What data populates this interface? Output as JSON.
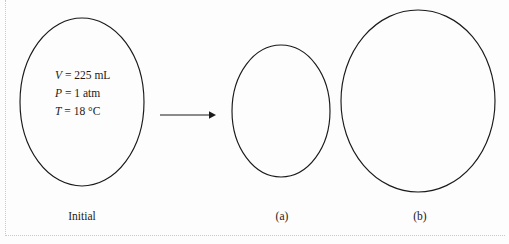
{
  "figure": {
    "type": "gas-law-balloon-diagram",
    "background_color": "#fdfdfd",
    "outline_color": "#1a1a1a",
    "border_color": "#c9c9c9"
  },
  "initial_state": {
    "properties": [
      {
        "symbol": "V",
        "equals": "=",
        "value": "225 mL"
      },
      {
        "symbol": "P",
        "equals": "=",
        "value": "1 atm"
      },
      {
        "symbol": "T",
        "equals": "=",
        "value": "18 °C"
      }
    ],
    "volume_line": "V = 225 mL",
    "pressure_line": "P = 1 atm",
    "temperature_line": "T = 18 °C"
  },
  "captions": {
    "initial": "Initial",
    "a": "(a)",
    "b": "(b)"
  },
  "balloons": [
    {
      "id": "initial",
      "cx": 82,
      "cy": 102,
      "rx": 62,
      "ry": 84
    },
    {
      "id": "a",
      "cx": 281,
      "cy": 111,
      "rx": 49,
      "ry": 66
    },
    {
      "id": "b",
      "cx": 418,
      "cy": 101,
      "rx": 77,
      "ry": 91
    }
  ],
  "arrow": {
    "name": "transition-arrow",
    "x1": 160,
    "y1": 115,
    "x2": 214,
    "y2": 115
  }
}
